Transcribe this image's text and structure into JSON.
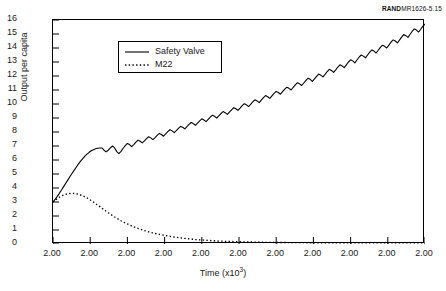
{
  "credit": {
    "brand": "RAND",
    "number": "MR1626-5.15"
  },
  "chart_data": {
    "type": "line",
    "title": "",
    "xlabel": "Time (x10",
    "xlabel_exponent": "3",
    "xlabel_close": ")",
    "ylabel": "Output per capita",
    "ylim": [
      0,
      16
    ],
    "yticks": [
      "0",
      "1",
      "2",
      "3",
      "4",
      "5",
      "6",
      "7",
      "8",
      "9",
      "10",
      "11",
      "12",
      "13",
      "14",
      "15",
      "16"
    ],
    "xticks": [
      "2.00",
      "2.00",
      "2.00",
      "2.00",
      "2.00",
      "2.00",
      "2.00",
      "2.00",
      "2.00",
      "2.00",
      "2.00"
    ],
    "grid": false,
    "legend_position": "upper-left-inset",
    "series": [
      {
        "name": "Safety Valve",
        "style": "solid",
        "color": "#000000",
        "values": [
          3.0,
          3.18,
          3.4,
          3.62,
          3.86,
          4.1,
          4.34,
          4.58,
          4.82,
          5.05,
          5.28,
          5.5,
          5.72,
          5.92,
          6.1,
          6.28,
          6.42,
          6.55,
          6.66,
          6.74,
          6.8,
          6.84,
          6.86,
          6.86,
          6.7,
          6.58,
          6.7,
          6.86,
          7.0,
          6.86,
          6.6,
          6.46,
          6.62,
          6.84,
          7.02,
          7.18,
          7.1,
          6.96,
          7.1,
          7.28,
          7.42,
          7.34,
          7.22,
          7.36,
          7.52,
          7.66,
          7.58,
          7.46,
          7.6,
          7.76,
          7.9,
          7.82,
          7.7,
          7.86,
          8.02,
          8.16,
          8.08,
          7.96,
          8.1,
          8.26,
          8.4,
          8.34,
          8.22,
          8.38,
          8.54,
          8.68,
          8.6,
          8.48,
          8.64,
          8.8,
          8.94,
          8.86,
          8.74,
          8.9,
          9.06,
          9.2,
          9.12,
          9.0,
          9.16,
          9.32,
          9.46,
          9.38,
          9.26,
          9.42,
          9.58,
          9.74,
          9.66,
          9.54,
          9.7,
          9.88,
          10.02,
          9.94,
          9.82,
          9.98,
          10.16,
          10.3,
          10.22,
          10.1,
          10.28,
          10.46,
          10.6,
          10.52,
          10.4,
          10.58,
          10.76,
          10.9,
          10.82,
          10.7,
          10.88,
          11.06,
          11.2,
          11.12,
          11.0,
          11.18,
          11.36,
          11.52,
          11.44,
          11.32,
          11.5,
          11.68,
          11.84,
          11.76,
          11.62,
          11.8,
          11.98,
          12.14,
          12.06,
          11.94,
          12.12,
          12.32,
          12.48,
          12.4,
          12.26,
          12.44,
          12.64,
          12.8,
          12.72,
          12.6,
          12.8,
          13.0,
          13.16,
          13.08,
          12.94,
          13.14,
          13.34,
          13.5,
          13.42,
          13.3,
          13.5,
          13.7,
          13.86,
          13.78,
          13.64,
          13.84,
          14.04,
          14.2,
          14.12,
          14.0,
          14.2,
          14.42,
          14.58,
          14.5,
          14.36,
          14.56,
          14.78,
          14.96,
          14.88,
          14.76,
          14.98,
          15.2,
          15.36,
          15.28,
          15.14,
          15.34,
          15.56,
          15.7
        ]
      },
      {
        "name": "M22",
        "style": "dotted",
        "color": "#000000",
        "values": [
          3.0,
          3.12,
          3.24,
          3.34,
          3.43,
          3.5,
          3.55,
          3.59,
          3.61,
          3.62,
          3.61,
          3.59,
          3.55,
          3.5,
          3.44,
          3.37,
          3.29,
          3.2,
          3.1,
          3.0,
          2.89,
          2.78,
          2.67,
          2.56,
          2.45,
          2.34,
          2.23,
          2.13,
          2.03,
          1.93,
          1.84,
          1.75,
          1.66,
          1.58,
          1.5,
          1.43,
          1.36,
          1.29,
          1.23,
          1.17,
          1.11,
          1.06,
          1.01,
          0.96,
          0.92,
          0.87,
          0.83,
          0.79,
          0.76,
          0.72,
          0.69,
          0.66,
          0.63,
          0.6,
          0.57,
          0.55,
          0.52,
          0.5,
          0.48,
          0.46,
          0.44,
          0.42,
          0.4,
          0.38,
          0.37,
          0.35,
          0.34,
          0.32,
          0.31,
          0.3,
          0.29,
          0.28,
          0.27,
          0.26,
          0.25,
          0.24,
          0.23,
          0.22,
          0.21,
          0.21,
          0.2,
          0.19,
          0.19,
          0.18,
          0.18,
          0.17,
          0.17,
          0.16,
          0.16,
          0.15,
          0.15,
          0.15,
          0.14,
          0.14,
          0.14,
          0.13,
          0.13,
          0.13,
          0.13,
          0.12,
          0.12,
          0.12,
          0.12,
          0.12,
          0.11,
          0.11,
          0.11,
          0.11,
          0.11,
          0.11,
          0.1,
          0.1,
          0.1,
          0.1,
          0.1,
          0.1,
          0.1,
          0.1,
          0.1,
          0.1,
          0.09,
          0.09,
          0.09,
          0.09,
          0.09,
          0.09,
          0.09,
          0.09,
          0.09,
          0.09,
          0.09,
          0.09,
          0.09,
          0.09,
          0.08,
          0.08,
          0.08,
          0.08,
          0.08,
          0.08,
          0.08,
          0.08,
          0.08,
          0.08,
          0.08,
          0.08,
          0.08,
          0.08,
          0.08,
          0.08,
          0.08,
          0.08,
          0.08,
          0.08,
          0.08,
          0.08,
          0.08,
          0.08,
          0.08,
          0.08,
          0.08,
          0.08,
          0.08,
          0.08,
          0.08,
          0.08,
          0.08,
          0.08,
          0.08,
          0.08,
          0.08,
          0.08,
          0.08,
          0.08,
          0.08,
          0.08
        ]
      }
    ]
  }
}
